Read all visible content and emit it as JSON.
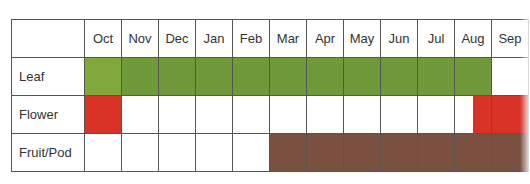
{
  "chart_data": {
    "type": "table",
    "title": "",
    "months": [
      "Oct",
      "Nov",
      "Dec",
      "Jan",
      "Feb",
      "Mar",
      "Apr",
      "May",
      "Jun",
      "Jul",
      "Aug",
      "Sep"
    ],
    "rows": [
      {
        "label": "Leaf",
        "color": "#6e9a3a",
        "active": [
          1,
          1,
          1,
          1,
          1,
          1,
          1,
          1,
          1,
          1,
          1,
          0
        ],
        "partial": {}
      },
      {
        "label": "Flower",
        "color": "#d93328",
        "active": [
          1,
          0,
          0,
          0,
          0,
          0,
          0,
          0,
          0,
          0,
          0.5,
          1
        ],
        "partial": {
          "10": "right-half"
        }
      },
      {
        "label": "Fruit/Pod",
        "color": "#7a5040",
        "active": [
          0,
          0,
          0,
          0,
          0,
          1,
          1,
          1,
          1,
          1,
          1,
          1
        ],
        "partial": {}
      }
    ],
    "legend": []
  },
  "colors": {
    "leaf": "#6e9a3a",
    "leaf_first": "#82a83c",
    "flower": "#d93328",
    "fruit": "#7a5040",
    "border": "#555555"
  }
}
